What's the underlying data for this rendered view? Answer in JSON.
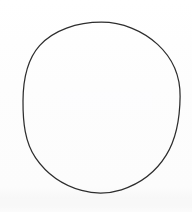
{
  "image": {
    "width": 192,
    "height": 212,
    "background_color": "#fdfdfd",
    "description": "Hand-drawn circle outline on white paper"
  },
  "shape": {
    "name": "circle",
    "type": "ellipse-outline",
    "filled": false,
    "stroke_color": "#2d2d2d",
    "stroke_width": 1.25,
    "center_x": 101.5,
    "center_y": 107.5,
    "radius_x": 78.5,
    "radius_y": 85.5,
    "bounds": {
      "left": 23,
      "top": 22,
      "right": 180,
      "bottom": 193
    }
  },
  "artifacts": {
    "scan_smudge_visible": true,
    "scan_band_visible": true
  }
}
